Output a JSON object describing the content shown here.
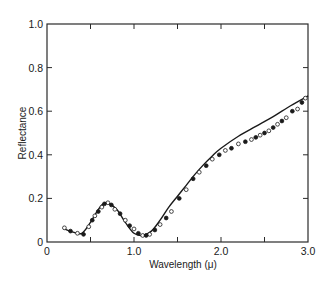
{
  "chart_data": {
    "type": "line",
    "title": "",
    "xlabel": "Wavelength (μ)",
    "ylabel": "Reflectance",
    "xlim": [
      0,
      3.0
    ],
    "ylim": [
      0,
      1.0
    ],
    "grid": false,
    "legend": null,
    "x_ticks": [
      0,
      0.5,
      1.0,
      1.5,
      2.0,
      2.5,
      3.0
    ],
    "x_tick_labels": [
      "0",
      "",
      "1.0",
      "",
      "2.0",
      "",
      "3.0"
    ],
    "y_ticks": [
      0,
      0.2,
      0.4,
      0.6,
      0.8,
      1.0
    ],
    "y_tick_labels": [
      "0",
      "0.2",
      "0.4",
      "0.6",
      "0.8",
      "1.0"
    ],
    "series": [
      {
        "name": "theoretical curve",
        "style": "solid-line",
        "x": [
          0.2,
          0.3,
          0.4,
          0.5,
          0.6,
          0.68,
          0.8,
          0.9,
          1.0,
          1.1,
          1.2,
          1.3,
          1.4,
          1.5,
          1.6,
          1.7,
          1.8,
          1.9,
          2.0,
          2.2,
          2.4,
          2.6,
          2.8,
          3.0
        ],
        "values": [
          0.06,
          0.045,
          0.04,
          0.09,
          0.155,
          0.18,
          0.15,
          0.09,
          0.04,
          0.03,
          0.05,
          0.1,
          0.16,
          0.21,
          0.26,
          0.31,
          0.355,
          0.395,
          0.43,
          0.485,
          0.53,
          0.575,
          0.625,
          0.67
        ]
      },
      {
        "name": "measured (open circles)",
        "style": "open-circle",
        "x": [
          0.2,
          0.35,
          0.48,
          0.55,
          0.63,
          0.7,
          0.78,
          0.9,
          1.0,
          1.1,
          1.18,
          1.3,
          1.43,
          1.6,
          1.75,
          1.9,
          2.05,
          2.2,
          2.35,
          2.45,
          2.55,
          2.65,
          2.75,
          2.88,
          2.97
        ],
        "values": [
          0.065,
          0.04,
          0.07,
          0.12,
          0.16,
          0.18,
          0.15,
          0.1,
          0.06,
          0.03,
          0.035,
          0.08,
          0.14,
          0.24,
          0.32,
          0.38,
          0.42,
          0.45,
          0.47,
          0.49,
          0.51,
          0.54,
          0.57,
          0.61,
          0.66
        ]
      },
      {
        "name": "measured (filled circles)",
        "style": "filled-circle",
        "x": [
          0.27,
          0.42,
          0.52,
          0.59,
          0.66,
          0.74,
          0.84,
          0.95,
          1.05,
          1.14,
          1.24,
          1.37,
          1.52,
          1.68,
          1.83,
          1.98,
          2.12,
          2.28,
          2.4,
          2.5,
          2.6,
          2.7,
          2.82,
          2.93
        ],
        "values": [
          0.05,
          0.035,
          0.1,
          0.14,
          0.175,
          0.17,
          0.13,
          0.075,
          0.04,
          0.03,
          0.055,
          0.11,
          0.2,
          0.29,
          0.35,
          0.4,
          0.43,
          0.46,
          0.48,
          0.5,
          0.525,
          0.555,
          0.6,
          0.64
        ]
      }
    ]
  },
  "axes": {
    "xlabel": "Wavelength (μ)",
    "ylabel": "Reflectance",
    "x_origin_label": "0",
    "y_origin_label": "0"
  }
}
